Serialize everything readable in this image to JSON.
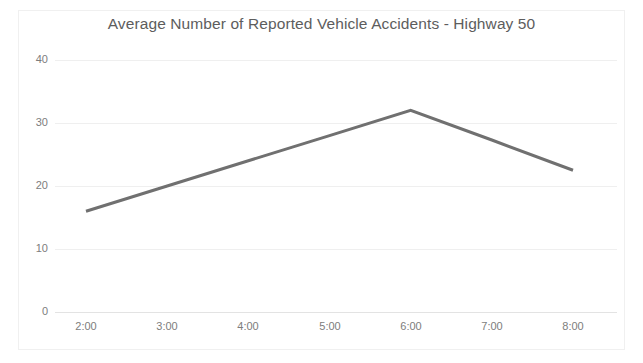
{
  "chart_data": {
    "type": "line",
    "title": "Average Number of Reported Vehicle Accidents - Highway 50",
    "xlabel": "",
    "ylabel": "",
    "categories": [
      "2:00",
      "3:00",
      "4:00",
      "5:00",
      "6:00",
      "7:00",
      "8:00"
    ],
    "series": [
      {
        "name": "Average Number of Reported Vehicle Accidents",
        "values": [
          16,
          20,
          24,
          28,
          32,
          27.3,
          22.5
        ]
      }
    ],
    "ylim": [
      0,
      40
    ],
    "yticks": [
      0,
      10,
      20,
      30,
      40
    ],
    "ytick_labels": [
      "0",
      "10",
      "20",
      "30",
      "40"
    ],
    "xtick_labels": [
      "2:00",
      "3:00",
      "4:00",
      "5:00",
      "6:00",
      "7:00",
      "8:00"
    ],
    "grid": true,
    "legend": false,
    "legend_position": "none",
    "markers": false,
    "line_color": "#707070",
    "line_width": 3,
    "grid_color": "#efefef",
    "title_color": "#5d5d5d",
    "tick_label_color": "#7d7d7d",
    "background_color": "#ffffff",
    "border_color": "#f0f0f0"
  }
}
